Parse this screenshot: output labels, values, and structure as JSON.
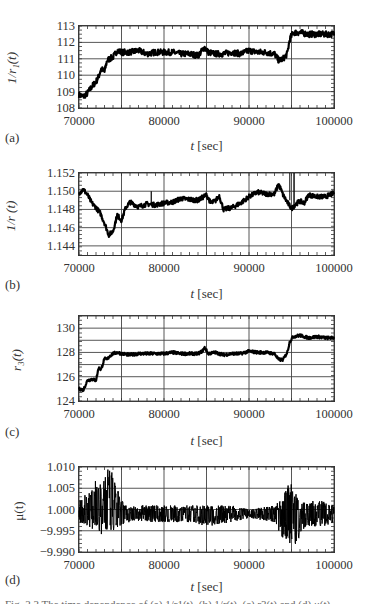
{
  "figure": {
    "caption_partial": "Fig. 2.3  The time dependence of (a) 1/r1(t), (b) 1/r(t), (c) r3(t) and (d) μ(t)"
  },
  "chart_data": [
    {
      "panel": "(a)",
      "type": "line",
      "ylabel": "1/r1(t)",
      "xlabel": "t [sec]",
      "xlim": [
        70000,
        100000
      ],
      "ylim": [
        108,
        113
      ],
      "xticks": [
        70000,
        80000,
        90000,
        100000
      ],
      "xtick_labels": [
        "70000",
        "80000",
        "90000",
        "100000"
      ],
      "yticks": [
        108,
        109,
        110,
        111,
        112,
        113
      ],
      "ytick_labels": [
        "108",
        "109",
        "110",
        "111",
        "112",
        "113"
      ],
      "grid": true,
      "x_grid": [
        70000,
        75000,
        80000,
        85000,
        90000,
        95000,
        100000
      ],
      "noise": 0.18,
      "series": [
        {
          "name": "1/r1(t)",
          "x": [
            70000,
            70500,
            71000,
            71500,
            72000,
            72300,
            72600,
            73000,
            73300,
            73600,
            74000,
            74500,
            75000,
            76000,
            77000,
            78000,
            79000,
            80000,
            81000,
            82000,
            83000,
            84000,
            84500,
            84800,
            85200,
            86000,
            87000,
            88000,
            89000,
            90000,
            91000,
            92000,
            93000,
            93500,
            94000,
            94500,
            94800,
            95200,
            96000,
            97000,
            98000,
            99000,
            100000
          ],
          "values": [
            108.8,
            108.7,
            108.9,
            109.3,
            109.6,
            109.9,
            110.4,
            110.2,
            110.9,
            111.0,
            111.1,
            111.5,
            111.4,
            111.4,
            111.5,
            111.3,
            111.4,
            111.4,
            111.4,
            111.3,
            111.3,
            111.2,
            111.5,
            111.7,
            111.4,
            111.3,
            111.3,
            111.4,
            111.3,
            111.5,
            111.4,
            111.4,
            111.3,
            110.9,
            111.0,
            111.3,
            112.2,
            112.6,
            112.6,
            112.5,
            112.5,
            112.5,
            112.5
          ]
        }
      ]
    },
    {
      "panel": "(b)",
      "type": "line",
      "ylabel": "1/r(t)",
      "xlabel": "t [sec]",
      "xlim": [
        70000,
        100000
      ],
      "ylim": [
        1.143,
        1.152
      ],
      "xticks": [
        70000,
        80000,
        90000,
        100000
      ],
      "xtick_labels": [
        "70000",
        "80000",
        "90000",
        "100000"
      ],
      "yticks": [
        1.144,
        1.146,
        1.148,
        1.15,
        1.152
      ],
      "ytick_labels": [
        "1.144",
        "1.146",
        "1.148",
        "1.150",
        "1.152"
      ],
      "grid": true,
      "x_grid": [
        70000,
        75000,
        80000,
        85000,
        90000,
        95000,
        100000
      ],
      "noise": 0.00025,
      "series": [
        {
          "name": "1/r(t)",
          "x": [
            70000,
            70500,
            71000,
            71500,
            72000,
            72500,
            73000,
            73500,
            74000,
            74500,
            75000,
            75500,
            76000,
            77000,
            78000,
            79000,
            80000,
            81000,
            82000,
            83000,
            84000,
            85000,
            85500,
            86000,
            86500,
            87000,
            88000,
            89000,
            90000,
            91000,
            92000,
            93000,
            93500,
            94000,
            94500,
            95000,
            95500,
            96000,
            96500,
            97000,
            98000,
            99000,
            100000
          ],
          "values": [
            1.1498,
            1.1502,
            1.1496,
            1.1487,
            1.1482,
            1.1476,
            1.1465,
            1.1452,
            1.1456,
            1.1474,
            1.1468,
            1.1482,
            1.1488,
            1.1483,
            1.1486,
            1.1485,
            1.1487,
            1.1488,
            1.1492,
            1.1491,
            1.149,
            1.1496,
            1.1487,
            1.1489,
            1.1495,
            1.148,
            1.1482,
            1.1487,
            1.1494,
            1.1499,
            1.1497,
            1.1497,
            1.1508,
            1.1496,
            1.1488,
            1.1481,
            1.1486,
            1.1489,
            1.1487,
            1.1496,
            1.1494,
            1.1494,
            1.1498
          ]
        }
      ]
    },
    {
      "panel": "(c)",
      "type": "line",
      "ylabel": "r3(t)",
      "xlabel": "t [sec]",
      "xlim": [
        70000,
        100000
      ],
      "ylim": [
        124,
        131
      ],
      "xticks": [
        70000,
        80000,
        90000,
        100000
      ],
      "xtick_labels": [
        "70000",
        "80000",
        "90000",
        "100000"
      ],
      "yticks": [
        124,
        126,
        128,
        130
      ],
      "ytick_labels": [
        "124",
        "126",
        "128",
        "130"
      ],
      "grid": true,
      "x_grid": [
        70000,
        75000,
        80000,
        85000,
        90000,
        95000,
        100000
      ],
      "y_grid": [
        124,
        125,
        126,
        127,
        128,
        129,
        130,
        131
      ],
      "noise": 0.12,
      "series": [
        {
          "name": "r3(t)",
          "x": [
            70000,
            70500,
            71000,
            71500,
            72000,
            72300,
            72600,
            73000,
            73300,
            73600,
            74000,
            74500,
            75000,
            76000,
            77000,
            78000,
            79000,
            80000,
            81000,
            82000,
            83000,
            84000,
            84500,
            84800,
            85200,
            86000,
            87000,
            88000,
            89000,
            90000,
            91000,
            92000,
            93000,
            93500,
            94000,
            94500,
            94800,
            95200,
            96000,
            97000,
            98000,
            99000,
            100000
          ],
          "values": [
            125.0,
            124.9,
            125.7,
            125.8,
            125.7,
            126.7,
            126.6,
            127.5,
            127.4,
            127.7,
            127.9,
            128.0,
            127.9,
            127.8,
            127.9,
            127.9,
            127.9,
            127.9,
            128.0,
            127.9,
            127.9,
            127.9,
            128.1,
            128.4,
            127.9,
            128.0,
            127.8,
            127.9,
            127.9,
            128.1,
            128.0,
            128.0,
            127.9,
            127.4,
            127.4,
            128.0,
            128.9,
            129.3,
            129.4,
            129.2,
            129.3,
            129.2,
            129.2
          ]
        }
      ]
    },
    {
      "panel": "(d)",
      "type": "line",
      "ylabel": "μ(t)",
      "xlabel": "t [sec]",
      "xlim": [
        70000,
        100000
      ],
      "ylim": [
        -0.99,
        1.01
      ],
      "xticks": [
        70000,
        80000,
        90000,
        100000
      ],
      "xtick_labels": [
        "70000",
        "80000",
        "90000",
        "100000"
      ],
      "yticks": [
        0.99,
        0.995,
        1.0,
        1.005,
        1.01
      ],
      "ytick_labels": [
        "−9.990",
        "−9.995",
        "1.000",
        "1.005",
        "1.010"
      ],
      "grid": true,
      "x_grid": [
        70000,
        75000,
        80000,
        85000,
        90000,
        95000,
        100000
      ],
      "note": "Tick labels printed as shown in source (−9.990/−9.995 appear to represent 0.990/0.995).",
      "baseline": 0.999,
      "series": [
        {
          "name": "μ(t) envelope",
          "x": [
            70000,
            71000,
            72000,
            72800,
            73300,
            74000,
            74800,
            75500,
            78000,
            80000,
            83000,
            85000,
            88000,
            90000,
            93000,
            94000,
            94800,
            95300,
            95800,
            97000,
            99000,
            100000
          ],
          "upper": [
            1.002,
            1.004,
            1.007,
            1.006,
            1.01,
            1.009,
            1.003,
            1.001,
            1.001,
            1.001,
            1.001,
            1.001,
            1.001,
            1.0,
            1.001,
            1.003,
            1.007,
            1.006,
            1.002,
            1.002,
            1.002,
            1.001
          ],
          "lower": [
            0.997,
            0.996,
            0.995,
            0.994,
            0.995,
            0.995,
            0.996,
            0.997,
            0.997,
            0.997,
            0.997,
            0.996,
            0.997,
            0.998,
            0.997,
            0.993,
            0.991,
            0.99,
            0.993,
            0.996,
            0.996,
            0.997
          ]
        }
      ]
    }
  ],
  "panels": [
    {
      "letter": "(a)",
      "ylabel": "1/r₁(t)",
      "xlabel_var": "t",
      "xlabel_unit": " [sec]"
    },
    {
      "letter": "(b)",
      "ylabel": "1/r (t)",
      "xlabel_var": "t",
      "xlabel_unit": " [sec]"
    },
    {
      "letter": "(c)",
      "ylabel": "r₃(t)",
      "xlabel_var": "t",
      "xlabel_unit": " [sec]"
    },
    {
      "letter": "(d)",
      "ylabel": "μ(t)",
      "xlabel_var": "t",
      "xlabel_unit": " [sec]"
    }
  ]
}
